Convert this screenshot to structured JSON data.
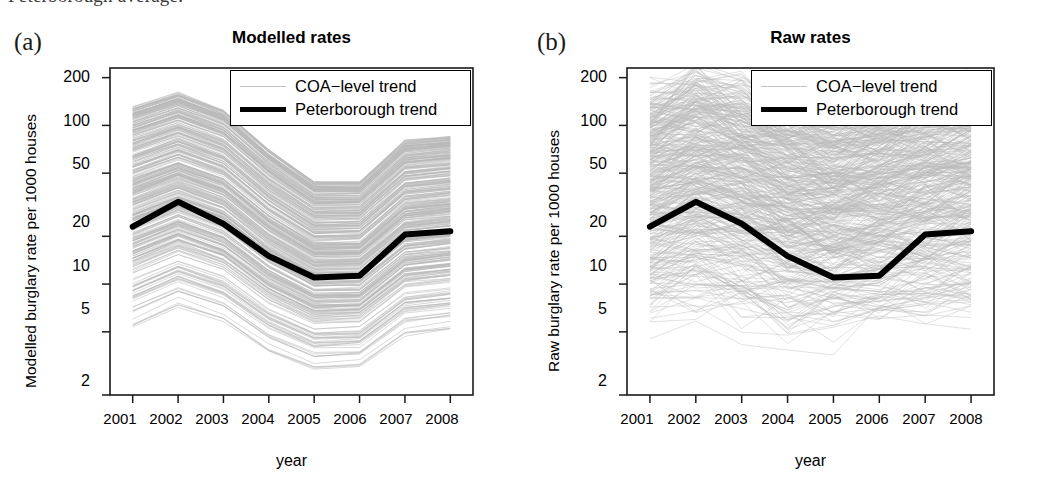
{
  "caption_fragment": "Peterborough average.",
  "figure": {
    "panels": [
      {
        "letter": "(a)",
        "title": "Modelled rates",
        "ylabel": "Modelled burglary rate per 1000 houses",
        "xlabel": "year",
        "legend": {
          "coa_label": "COA−level trend",
          "peterborough_label": "Peterborough trend"
        }
      },
      {
        "letter": "(b)",
        "title": "Raw rates",
        "ylabel": "Raw burglary rate per 1000 houses",
        "xlabel": "year",
        "legend": {
          "coa_label": "COA−level trend",
          "peterborough_label": "Peterborough trend"
        }
      }
    ]
  },
  "colors": {
    "trend_line": "#000000",
    "coa_line": "#b9b9b9",
    "axis": "#1a1a1a",
    "background": "#ffffff"
  },
  "chart_data": [
    {
      "type": "line",
      "title": "Modelled rates",
      "panel": "(a)",
      "xlabel": "year",
      "ylabel": "Modelled burglary rate per 1000 houses",
      "yscale": "log",
      "ylim": [
        2,
        230
      ],
      "yticks": [
        200,
        100,
        50,
        20,
        10,
        5,
        2
      ],
      "ytick_labels": [
        "200",
        "100",
        "50",
        "20",
        "10",
        "5",
        "2"
      ],
      "x": [
        2001,
        2002,
        2003,
        2004,
        2005,
        2006,
        2007,
        2008
      ],
      "xtick_labels": [
        "2001",
        "2002",
        "2003",
        "2004",
        "2005",
        "2006",
        "2007",
        "2008"
      ],
      "grid": false,
      "legend_position": "top-right",
      "series": [
        {
          "name": "Peterborough trend",
          "style": "thick-black",
          "values": [
            23,
            33,
            24,
            15,
            11,
            11.3,
            20.5,
            21.5
          ]
        },
        {
          "name": "COA-level trend",
          "style": "thin-grey-bundle",
          "description": "Several hundred smooth COA-level curves, parallel to the Peterborough trend, spanning roughly 5 to 130 per 1000 houses in 2001, narrowing to roughly 3 to 45 at the 2005 minimum and widening to about 5 to 85 by 2008.",
          "envelope_high": [
            130,
            160,
            125,
            70,
            44,
            44,
            80,
            85
          ],
          "envelope_low": [
            5.2,
            7.0,
            5.6,
            3.6,
            2.8,
            2.9,
            4.6,
            5.0
          ],
          "n_lines": 400
        }
      ]
    },
    {
      "type": "line",
      "title": "Raw rates",
      "panel": "(b)",
      "xlabel": "year",
      "ylabel": "Raw burglary rate per 1000 houses",
      "yscale": "log",
      "ylim": [
        2,
        230
      ],
      "yticks": [
        200,
        100,
        50,
        20,
        10,
        5,
        2
      ],
      "ytick_labels": [
        "200",
        "100",
        "50",
        "20",
        "10",
        "5",
        "2"
      ],
      "x": [
        2001,
        2002,
        2003,
        2004,
        2005,
        2006,
        2007,
        2008
      ],
      "xtick_labels": [
        "2001",
        "2002",
        "2003",
        "2004",
        "2005",
        "2006",
        "2007",
        "2008"
      ],
      "grid": false,
      "legend_position": "top-right",
      "series": [
        {
          "name": "Peterborough trend",
          "style": "thick-black",
          "values": [
            23,
            33,
            24,
            15,
            11,
            11.3,
            20.5,
            21.5
          ]
        },
        {
          "name": "COA-level trend",
          "style": "thin-grey-noisy",
          "description": "Several hundred noisy zig-zag COA-level series with large year-to-year jumps, spanning roughly 5 to 200 per 1000 houses across the period.",
          "envelope_high": [
            150,
            200,
            165,
            120,
            105,
            125,
            160,
            175
          ],
          "envelope_low": [
            5.5,
            6.5,
            5.5,
            4.8,
            5.0,
            5.2,
            5.5,
            6.0
          ],
          "n_lines": 450
        }
      ]
    }
  ]
}
